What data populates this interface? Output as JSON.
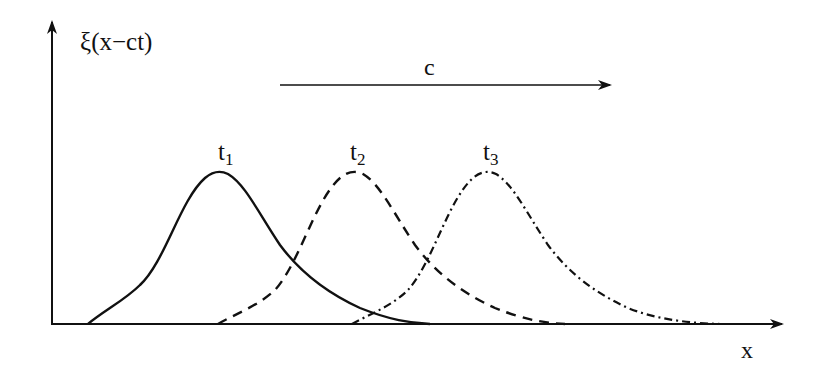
{
  "diagram": {
    "y_axis_label": "ξ(x−ct)",
    "x_axis_label": "x",
    "velocity_label": "c",
    "curves": [
      {
        "label": "t",
        "subscript": "1",
        "line_style": "solid",
        "peak_x": 222
      },
      {
        "label": "t",
        "subscript": "2",
        "line_style": "dashed",
        "peak_x": 357
      },
      {
        "label": "t",
        "subscript": "3",
        "line_style": "dash-dot",
        "peak_x": 490
      }
    ],
    "colors": {
      "ink": "#111111",
      "background": "#ffffff"
    }
  }
}
